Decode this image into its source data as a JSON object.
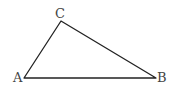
{
  "diagram": {
    "type": "triangle",
    "vertices": [
      {
        "id": "A",
        "label": "A",
        "x": 24,
        "y": 78,
        "label_x": 13,
        "label_y": 82
      },
      {
        "id": "B",
        "label": "B",
        "x": 156,
        "y": 78,
        "label_x": 157,
        "label_y": 82
      },
      {
        "id": "C",
        "label": "C",
        "x": 61,
        "y": 21,
        "label_x": 55,
        "label_y": 18
      }
    ],
    "edges": [
      {
        "from": "A",
        "to": "B"
      },
      {
        "from": "B",
        "to": "C"
      },
      {
        "from": "C",
        "to": "A"
      }
    ],
    "colors": {
      "stroke": "#222222",
      "label": "#444444",
      "background": "#ffffff"
    }
  }
}
